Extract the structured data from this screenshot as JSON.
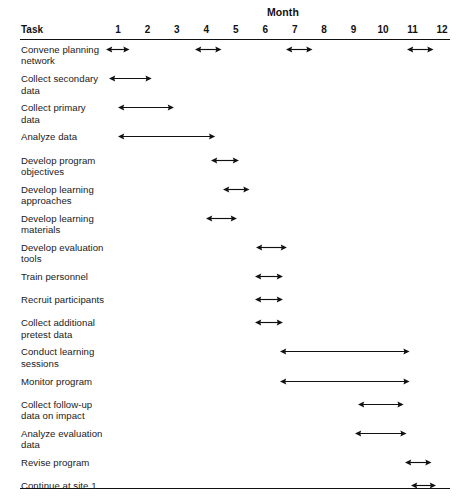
{
  "header": {
    "month_title": "Month",
    "task_column_label": "Task",
    "months": [
      "1",
      "2",
      "3",
      "4",
      "5",
      "6",
      "7",
      "8",
      "9",
      "10",
      "11",
      "12"
    ]
  },
  "style": {
    "line_color": "#111111",
    "text_color": "#1a1a1a",
    "background": "#ffffff"
  },
  "chart_data": {
    "type": "bar",
    "title": "Month",
    "xlabel": "Month",
    "ylabel": "Task",
    "xlim": [
      0.5,
      12.5
    ],
    "grid": false,
    "legend": null,
    "categories": [
      "Convene planning network",
      "Collect secondary data",
      "Collect primary data",
      "Analyze data",
      "Develop program objectives",
      "Develop learning approaches",
      "Develop learning materials",
      "Develop evaluation tools",
      "Train personnel",
      "Recruit participants",
      "Collect additional pretest data",
      "Conduct learning sessions",
      "Monitor program",
      "Collect follow-up data on impact",
      "Analyze evaluation data",
      "Revise program",
      "Continue at site 1",
      "Expand to site 2"
    ],
    "xtick_labels": [
      "1",
      "2",
      "3",
      "4",
      "5",
      "6",
      "7",
      "8",
      "9",
      "10",
      "11",
      "12"
    ],
    "xtick_values": [
      1,
      2,
      3,
      4,
      5,
      6,
      7,
      8,
      9,
      10,
      11,
      12
    ],
    "tasks": [
      {
        "label": "Convene planning\nnetwork",
        "spans": [
          {
            "start": 0.6,
            "end": 1.4
          },
          {
            "start": 3.6,
            "end": 4.5
          },
          {
            "start": 6.7,
            "end": 7.6
          },
          {
            "start": 10.8,
            "end": 11.7
          }
        ]
      },
      {
        "label": "Collect secondary\ndata",
        "spans": [
          {
            "start": 0.7,
            "end": 2.15
          }
        ]
      },
      {
        "label": "Collect primary\ndata",
        "spans": [
          {
            "start": 1.0,
            "end": 2.9
          }
        ]
      },
      {
        "label": "Analyze data",
        "spans": [
          {
            "start": 1.0,
            "end": 4.3
          }
        ]
      },
      {
        "label": "Develop program\nobjectives",
        "spans": [
          {
            "start": 4.15,
            "end": 5.1
          }
        ]
      },
      {
        "label": "Develop learning\napproaches",
        "spans": [
          {
            "start": 4.55,
            "end": 5.45
          }
        ]
      },
      {
        "label": "Develop learning\nmaterials",
        "spans": [
          {
            "start": 4.0,
            "end": 5.05
          }
        ]
      },
      {
        "label": "Develop evaluation\ntools",
        "spans": [
          {
            "start": 5.7,
            "end": 6.75
          }
        ]
      },
      {
        "label": "Train personnel",
        "spans": [
          {
            "start": 5.65,
            "end": 6.6
          }
        ]
      },
      {
        "label": "Recruit participants",
        "spans": [
          {
            "start": 5.65,
            "end": 6.6
          }
        ]
      },
      {
        "label": "Collect additional\npretest data",
        "spans": [
          {
            "start": 5.65,
            "end": 6.6
          }
        ]
      },
      {
        "label": "Conduct learning\nsessions",
        "spans": [
          {
            "start": 6.5,
            "end": 10.9
          }
        ]
      },
      {
        "label": "Monitor program",
        "spans": [
          {
            "start": 6.5,
            "end": 10.9
          }
        ]
      },
      {
        "label": "Collect follow-up\ndata on impact",
        "spans": [
          {
            "start": 9.15,
            "end": 10.7
          }
        ]
      },
      {
        "label": "Analyze evaluation\ndata",
        "spans": [
          {
            "start": 9.05,
            "end": 10.8
          }
        ]
      },
      {
        "label": "Revise program",
        "spans": [
          {
            "start": 10.75,
            "end": 11.65
          }
        ]
      },
      {
        "label": "Continue at site 1",
        "spans": [
          {
            "start": 10.95,
            "end": 11.8
          }
        ]
      },
      {
        "label": "Expand to site 2",
        "spans": [
          {
            "start": 11.0,
            "end": 11.75
          }
        ]
      }
    ]
  }
}
